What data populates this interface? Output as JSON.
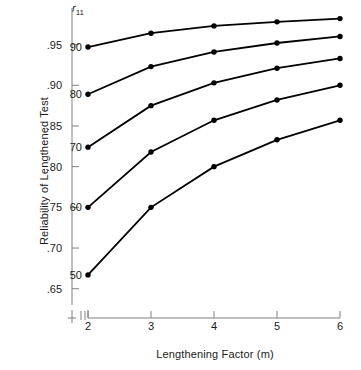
{
  "chart_data": {
    "type": "line",
    "title": "",
    "xlabel": "Lengthening Factor (m)",
    "ylabel": "Reliability of Lengthened Test",
    "legend_title": "r11",
    "legend_position": "inline-left-endpoints",
    "grid": false,
    "x": [
      2,
      3,
      4,
      5,
      6
    ],
    "xticks": [
      "2",
      "3",
      "4",
      "5",
      "6"
    ],
    "xlim": [
      2,
      6
    ],
    "yticks": [
      ".95",
      ".90",
      ".85",
      ".80",
      ".75",
      ".70",
      ".65"
    ],
    "ytick_values": [
      0.95,
      0.9,
      0.85,
      0.8,
      0.75,
      0.7,
      0.65
    ],
    "ylim": [
      0.63,
      0.995
    ],
    "x_axis_break": true,
    "series": [
      {
        "name": "90",
        "r11": 0.9,
        "label": "90",
        "values": [
          0.947,
          0.964,
          0.973,
          0.978,
          0.982
        ]
      },
      {
        "name": "80",
        "r11": 0.8,
        "label": "80",
        "values": [
          0.889,
          0.923,
          0.941,
          0.952,
          0.96
        ]
      },
      {
        "name": "70",
        "r11": 0.7,
        "label": "70",
        "values": [
          0.824,
          0.875,
          0.903,
          0.921,
          0.933
        ]
      },
      {
        "name": "60",
        "r11": 0.6,
        "label": "60",
        "values": [
          0.75,
          0.818,
          0.857,
          0.882,
          0.9
        ]
      },
      {
        "name": "50",
        "r11": 0.5,
        "label": "50",
        "values": [
          0.667,
          0.75,
          0.8,
          0.833,
          0.857
        ]
      }
    ],
    "colors": {
      "line": "#000000",
      "marker": "#000000",
      "axis": "#808080",
      "text": "#1a1a1a"
    }
  }
}
